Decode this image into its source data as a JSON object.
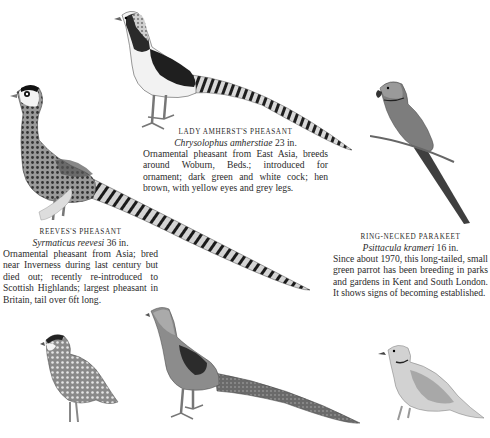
{
  "captions": {
    "lady_amherst": {
      "name": "Lady Amherst's Pheasant",
      "scientific": "Chrysolophus amherstiae",
      "size": "23 in.",
      "description": "Ornamental pheasant from East Asia, breeds around Woburn, Beds.; introduced for ornament; dark green and white cock; hen brown, with yellow eyes and grey legs."
    },
    "reeves": {
      "name": "Reeves's Pheasant",
      "scientific": "Syrmaticus reevesi",
      "size": "36 in.",
      "description": "Ornamental pheasant from Asia; bred near Inverness during last century but died out; recently re-introduced to Scottish Highlands; largest pheasant in Britain, tail over 6ft long."
    },
    "parakeet": {
      "name": "Ring-necked Parakeet",
      "scientific": "Psittacula krameri",
      "size": "16 in.",
      "description": "Since about 1970, this long-tailed, small green parrot has been breeding in parks and gardens in Kent and South London. It shows signs of becoming established."
    }
  },
  "illustrations": [
    {
      "id": "lady-amherst-pheasant",
      "position": "top-center"
    },
    {
      "id": "reeves-pheasant",
      "position": "left"
    },
    {
      "id": "ring-necked-parakeet",
      "position": "right"
    },
    {
      "id": "bobwhite-quail",
      "position": "bottom-left"
    },
    {
      "id": "golden-pheasant-hen",
      "position": "bottom-center"
    },
    {
      "id": "collared-dove",
      "position": "bottom-right"
    }
  ]
}
